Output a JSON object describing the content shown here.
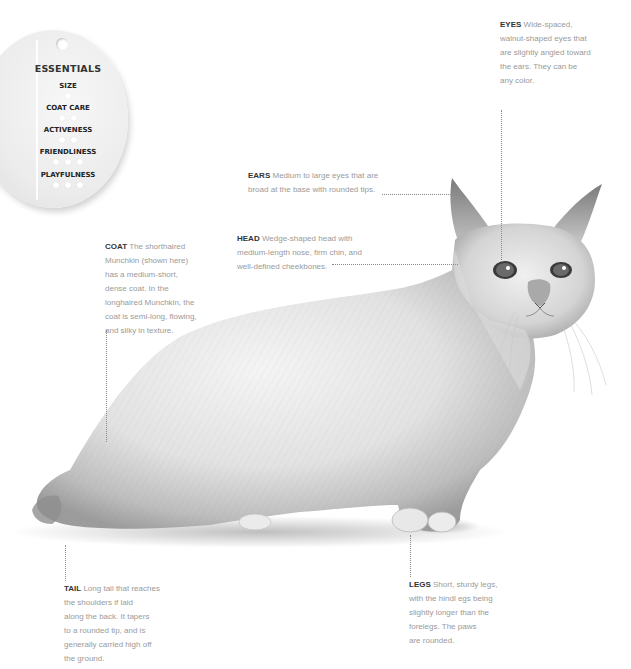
{
  "essentials": {
    "title": "ESSENTIALS",
    "ratings": [
      {
        "label": "SIZE",
        "paws": 1
      },
      {
        "label": "COAT CARE",
        "paws": 2
      },
      {
        "label": "ACTIVENESS",
        "paws": 2
      },
      {
        "label": "FRIENDLINESS",
        "paws": 3
      },
      {
        "label": "PLAYFULNESS",
        "paws": 3
      }
    ]
  },
  "annotations": {
    "eyes": {
      "label": "EYES",
      "text": "Wide-spaced, walnut-shaped eyes that are slightly angled toward the ears. They can be any color.",
      "lines": [
        "Wide-spaced,",
        "walnut-shaped eyes that",
        "are slightly angled toward",
        "the ears. They can be",
        "any color."
      ]
    },
    "ears": {
      "label": "EARS",
      "lines": [
        "Medium to large eyes that are",
        "broad at the base with rounded tips."
      ]
    },
    "head": {
      "label": "HEAD",
      "lines": [
        "Wedge-shaped head with",
        "medium-length nose, firm chin, and",
        "well-defined cheekbones."
      ]
    },
    "coat": {
      "label": "COAT",
      "lines": [
        "The shorthaired",
        "Munchkin (shown here)",
        "has a medium-short,",
        "dense coat. In the",
        "longhaired Munchkin, the",
        "coat is semi-long, flowing,",
        "and silky  in texture."
      ]
    },
    "tail": {
      "label": "TAIL",
      "lines": [
        "Long tail that reaches",
        "the shoulders if laid",
        "along the back. It tapers",
        "to a rounded tip, and is",
        "generally carried high off",
        "the ground."
      ]
    },
    "legs": {
      "label": "LEGS",
      "lines": [
        "Short, sturdy legs,",
        "with the hindl egs being",
        "slightly longer than the",
        "forelegs. The paws",
        "are rounded."
      ]
    }
  },
  "image": {
    "subject": "white shorthaired Munchkin cat, side view, grayscale"
  },
  "colors": {
    "label": "#333333",
    "body_text": "#9a9a9a",
    "leader": "#8a8a8a",
    "background": "#ffffff"
  }
}
